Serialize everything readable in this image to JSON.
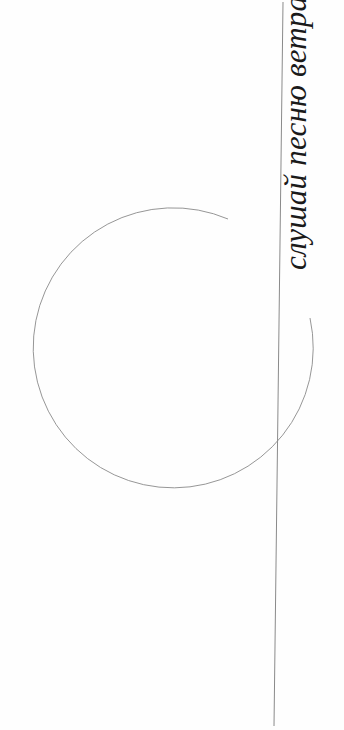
{
  "caption": {
    "text": "слушай песню ветра",
    "orientation": "rotated-90-ccw"
  },
  "colors": {
    "background": "#fefefe",
    "stroke": "#8a8a8a",
    "text": "#1a1a1a"
  },
  "shapes": {
    "circle": {
      "cx": 170,
      "cy": 344,
      "r": 140,
      "style": "open-arc"
    },
    "line": {
      "x1": 283,
      "y1": 2,
      "x2": 274,
      "y2": 726
    }
  }
}
